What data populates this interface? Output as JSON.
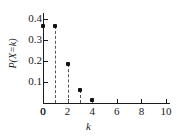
{
  "chart_data": {
    "type": "scatter",
    "title": "",
    "xlabel": "k",
    "ylabel": "P(X=k)",
    "x": [
      0,
      1,
      2,
      3,
      4
    ],
    "values": [
      0.368,
      0.368,
      0.184,
      0.061,
      0.015
    ],
    "xlim": [
      0,
      10
    ],
    "ylim": [
      0,
      0.42
    ],
    "xticks": [
      "0",
      "2",
      "4",
      "6",
      "8",
      "10"
    ],
    "xtick_values": [
      0,
      2,
      4,
      6,
      8,
      10
    ],
    "yticks": [
      "0",
      "0.1",
      "0.2",
      "0.3",
      "0.4"
    ],
    "ytick_values": [
      0,
      0.1,
      0.2,
      0.3,
      0.4
    ],
    "grid": false,
    "legend": null,
    "marker": "filled-square",
    "stems": "dashed",
    "colors": {
      "axis": "#1a1a1a",
      "marker": "#111111",
      "stem": "#555555",
      "background": "#ffffff"
    }
  }
}
